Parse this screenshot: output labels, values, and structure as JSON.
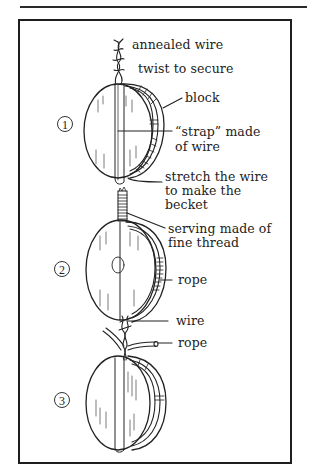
{
  "figure": {
    "steps": [
      {
        "number": "1",
        "labels": {
          "annealed_wire": "annealed wire",
          "twist": "twist to secure",
          "block": "block",
          "strap_line1": "“strap” made",
          "strap_line2": "of wire",
          "stretch_line1": "stretch the wire",
          "stretch_line2": "to make the",
          "stretch_line3": "becket"
        }
      },
      {
        "number": "2",
        "labels": {
          "serving_line1": "serving made of",
          "serving_line2": "fine thread",
          "rope": "rope"
        }
      },
      {
        "number": "3",
        "labels": {
          "wire": "wire",
          "rope": "rope"
        }
      }
    ],
    "colors": {
      "ink": "#222222",
      "paper": "#ffffff"
    }
  }
}
